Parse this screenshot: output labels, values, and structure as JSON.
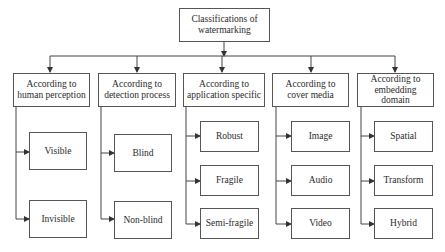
{
  "diagram": {
    "root": {
      "label": "Classifications of watermarking"
    },
    "categories": [
      {
        "label": "According to human perception",
        "children": [
          "Visible",
          "Invisible"
        ]
      },
      {
        "label": "According to detection process",
        "children": [
          "Blind",
          "Non-blind"
        ]
      },
      {
        "label": "According to application specific",
        "children": [
          "Robust",
          "Fragile",
          "Semi-fragile"
        ]
      },
      {
        "label": "According to cover media",
        "children": [
          "Image",
          "Audio",
          "Video"
        ]
      },
      {
        "label": "According to embedding domain",
        "children": [
          "Spatial",
          "Transform",
          "Hybrid"
        ]
      }
    ],
    "colors": {
      "line": "#444444",
      "border": "#555555",
      "background": "#ffffff"
    }
  }
}
